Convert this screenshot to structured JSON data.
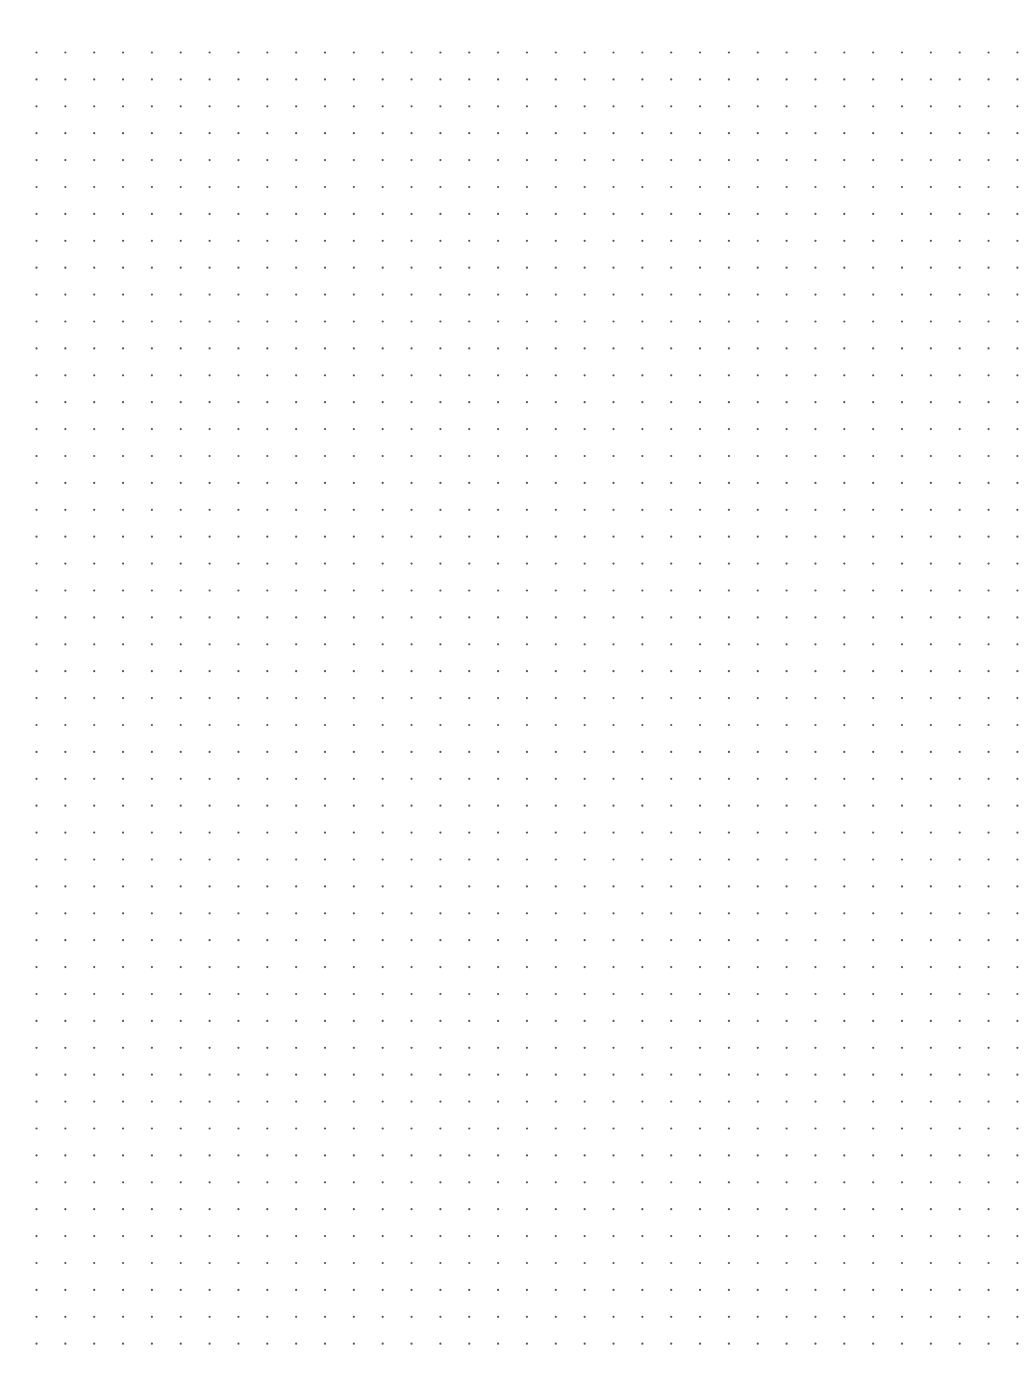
{
  "page": {
    "type": "dot-grid-paper",
    "background_color": "#ffffff",
    "dot_color": "#555555"
  },
  "grid": {
    "columns": 35,
    "rows": 49,
    "origin_x": 36.5,
    "origin_y": 52.5,
    "spacing_x": 28.85,
    "spacing_y": 26.9,
    "dot_radius": 1.1
  },
  "footer": {
    "mark": ""
  }
}
